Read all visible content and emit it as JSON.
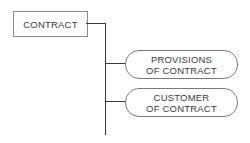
{
  "root": {
    "label": "CONTRACT"
  },
  "children": [
    {
      "line1": "PROVISIONS",
      "line2": "OF CONTRACT"
    },
    {
      "line1": "CUSTOMER",
      "line2": "OF CONTRACT"
    }
  ],
  "colors": {
    "line": "#3a3a3a",
    "border": "#8a8a8a",
    "text": "#3a3a3a"
  }
}
